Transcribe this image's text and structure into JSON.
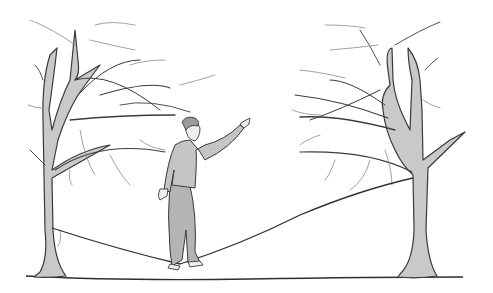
{
  "image": {
    "caption": "",
    "description": "Pencil illustration of a man balancing on a slackline strung between two bare trees",
    "colors": {
      "background": "#ffffff",
      "trunk": "#c9c9c9",
      "ink": "#3a3a3a",
      "clothing": "#c4c4c4"
    }
  }
}
